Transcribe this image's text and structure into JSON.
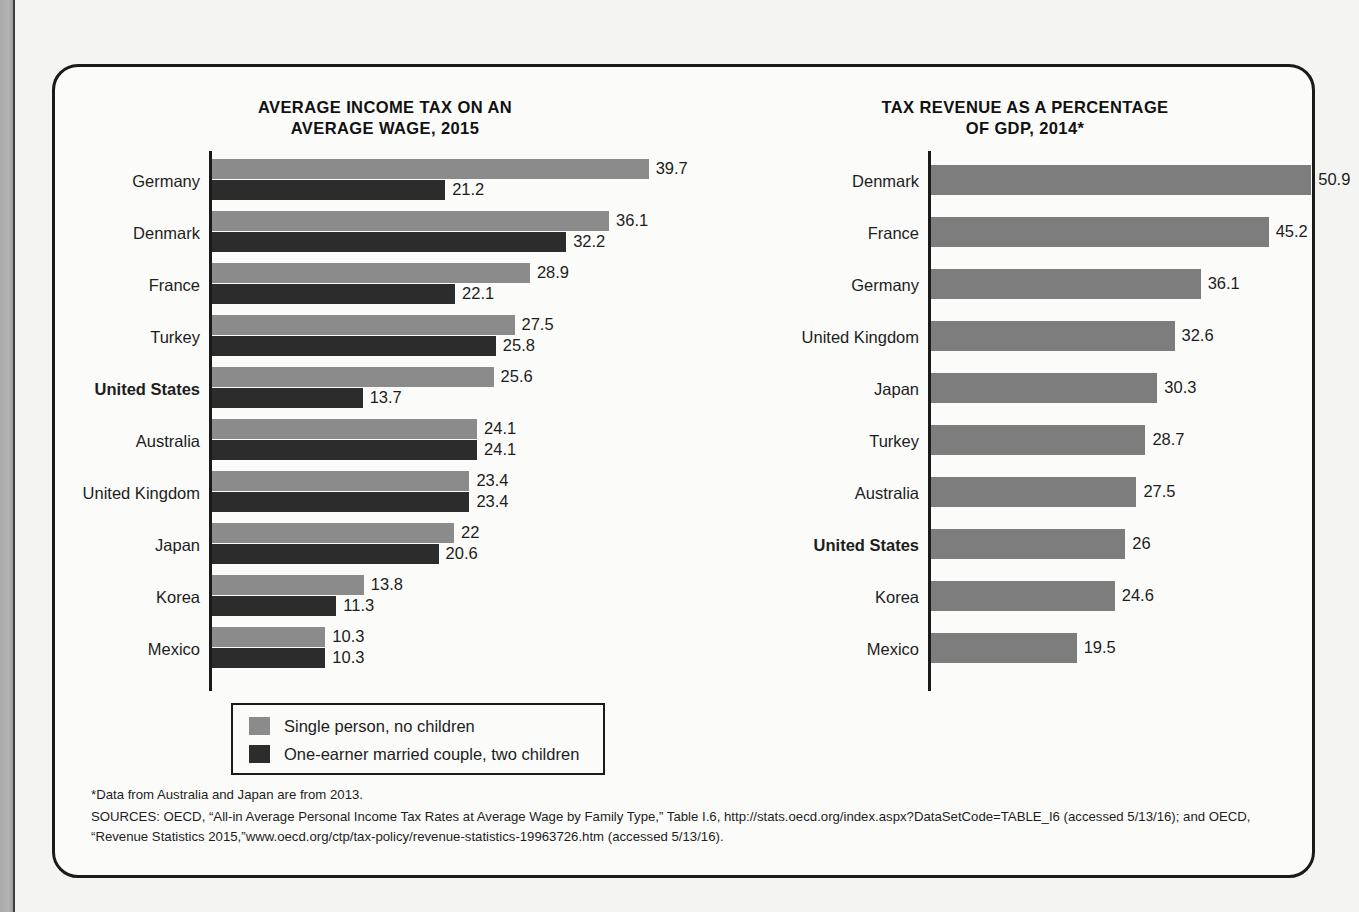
{
  "figure": {
    "footnote_star": "*Data from Australia and Japan are from 2013.",
    "footnote_sources": "SOURCES: OECD, “All-in Average Personal Income Tax Rates at Average Wage by Family Type,” Table I.6, http://stats.oecd.org/index.aspx?DataSetCode=TABLE_I6 (accessed 5/13/16); and OECD, “Revenue Statistics 2015,”www.oecd.org/ctp/tax-policy/revenue-statistics-19963726.htm (accessed 5/13/16)."
  },
  "legend": {
    "items": [
      {
        "label": "Single person, no children",
        "color": "#8b8b8b"
      },
      {
        "label": "One-earner married couple, two children",
        "color": "#2c2c2c"
      }
    ]
  },
  "chart_data": [
    {
      "type": "bar",
      "orientation": "horizontal",
      "title": "AVERAGE INCOME TAX ON AN AVERAGE WAGE, 2015",
      "title_lines": [
        "AVERAGE INCOME TAX ON AN",
        "AVERAGE WAGE, 2015"
      ],
      "xlabel": "",
      "ylabel": "",
      "xlim": [
        0,
        39.7
      ],
      "grid": false,
      "legend_position": "bottom-left",
      "categories": [
        "Germany",
        "Denmark",
        "France",
        "Turkey",
        "United States",
        "Australia",
        "United Kingdom",
        "Japan",
        "Korea",
        "Mexico"
      ],
      "highlighted_category": "United States",
      "series": [
        {
          "name": "Single person, no children",
          "color": "#8b8b8b",
          "values": [
            39.7,
            36.1,
            28.9,
            27.5,
            25.6,
            24.1,
            23.4,
            22,
            13.8,
            10.3
          ],
          "labels": [
            "39.7",
            "36.1",
            "28.9",
            "27.5",
            "25.6",
            "24.1",
            "23.4",
            "22",
            "13.8",
            "10.3"
          ]
        },
        {
          "name": "One-earner married couple, two children",
          "color": "#2c2c2c",
          "values": [
            21.2,
            32.2,
            22.1,
            25.8,
            13.7,
            24.1,
            23.4,
            20.6,
            11.3,
            10.3
          ],
          "labels": [
            "21.2",
            "32.2",
            "22.1",
            "25.8",
            "13.7",
            "24.1",
            "23.4",
            "20.6",
            "11.3",
            "10.3"
          ]
        }
      ]
    },
    {
      "type": "bar",
      "orientation": "horizontal",
      "title": "TAX REVENUE AS A PERCENTAGE OF GDP, 2014*",
      "title_lines": [
        "TAX REVENUE AS A PERCENTAGE",
        "OF GDP, 2014*"
      ],
      "xlabel": "",
      "ylabel": "",
      "xlim": [
        0,
        50.9
      ],
      "grid": false,
      "legend_position": "none",
      "categories": [
        "Denmark",
        "France",
        "Germany",
        "United Kingdom",
        "Japan",
        "Turkey",
        "Australia",
        "United States",
        "Korea",
        "Mexico"
      ],
      "highlighted_category": "United States",
      "series": [
        {
          "name": "Tax revenue as a percentage of GDP",
          "color": "#7d7d7d",
          "values": [
            50.9,
            45.2,
            36.1,
            32.6,
            30.3,
            28.7,
            27.5,
            26,
            24.6,
            19.5
          ],
          "labels": [
            "50.9",
            "45.2",
            "36.1",
            "32.6",
            "30.3",
            "28.7",
            "27.5",
            "26",
            "24.6",
            "19.5"
          ]
        }
      ]
    }
  ]
}
